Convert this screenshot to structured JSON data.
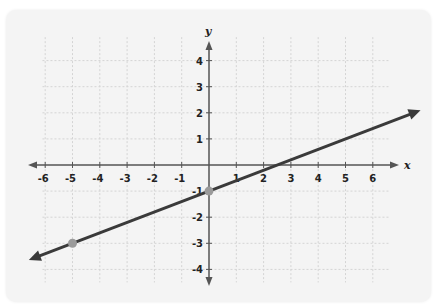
{
  "chart_data": {
    "type": "line",
    "title": "",
    "xlabel": "x",
    "ylabel": "y",
    "xlim": [
      -6.5,
      6.5
    ],
    "ylim": [
      -4.5,
      4.5
    ],
    "grid": true,
    "x_ticks": [
      -6,
      -5,
      -4,
      -3,
      -2,
      -1,
      1,
      2,
      3,
      4,
      5,
      6
    ],
    "y_ticks": [
      4,
      3,
      2,
      1,
      -1,
      -2,
      -3,
      -4
    ],
    "x_tick_labels": [
      "-6",
      "-5",
      "-4",
      "-3",
      "-2",
      "-1",
      "1",
      "2",
      "3",
      "4",
      "5",
      "6"
    ],
    "y_tick_labels": [
      "4",
      "3",
      "2",
      "1",
      "-1",
      "-2",
      "-3",
      "-4"
    ],
    "series": [
      {
        "name": "line",
        "equation": "y = (2/5)x - 1",
        "slope": 0.4,
        "intercept": -1,
        "x": [
          -6.6,
          7.75
        ],
        "y": [
          -3.64,
          2.1
        ],
        "arrows": "both",
        "color": "#3a3a3a"
      }
    ],
    "points": [
      {
        "x": 0,
        "y": -1,
        "color": "#9a9a9a"
      },
      {
        "x": -5,
        "y": -3,
        "color": "#9a9a9a"
      }
    ]
  },
  "labels": {
    "x_axis": "x",
    "y_axis": "y"
  },
  "colors": {
    "background": "#f4f4f4",
    "grid": "#d4d4d4",
    "axis": "#555555",
    "line": "#3a3a3a",
    "point": "#9a9a9a"
  }
}
